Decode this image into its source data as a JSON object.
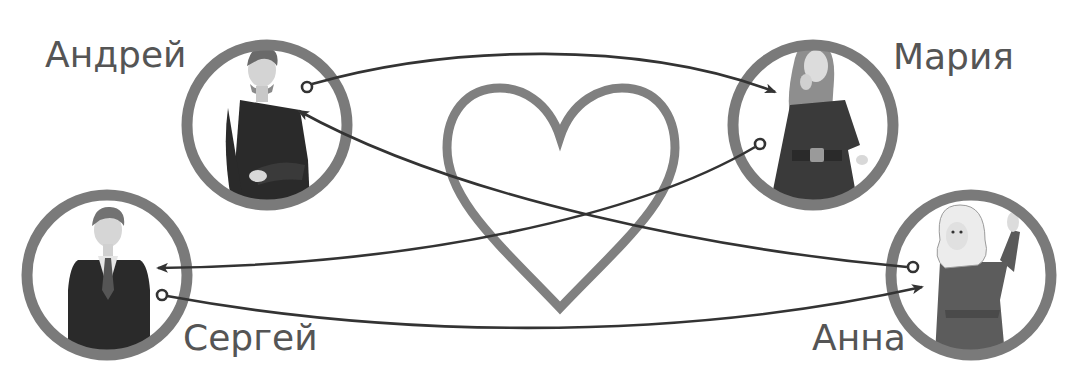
{
  "diagram": {
    "type": "relationship-diagram",
    "colors": {
      "ring": "#7a7a7a",
      "heart": "#808080",
      "arrow": "#333333",
      "label": "#555555",
      "background": "#ffffff"
    },
    "center_symbol": "heart-outline",
    "people": [
      {
        "id": "andrey",
        "name": "Андрей",
        "gender": "male",
        "outfit": "dark jacket, arms crossed"
      },
      {
        "id": "maria",
        "name": "Мария",
        "gender": "female",
        "outfit": "dark coat with belt, laughing"
      },
      {
        "id": "sergey",
        "name": "Сергей",
        "gender": "male",
        "outfit": "dark suit and tie"
      },
      {
        "id": "anna",
        "name": "Анна",
        "gender": "female",
        "outfit": "dark coat, blonde hair, hand raised"
      }
    ],
    "relations": [
      {
        "from": "Андрей",
        "to": "Мария"
      },
      {
        "from": "Мария",
        "to": "Сергей"
      },
      {
        "from": "Сергей",
        "to": "Анна"
      },
      {
        "from": "Анна",
        "to": "Андрей"
      }
    ]
  }
}
